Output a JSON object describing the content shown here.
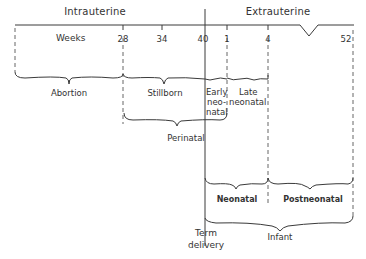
{
  "diagram": {
    "headers": {
      "intrauterine": "Intrauterine",
      "extrauterine": "Extrauterine"
    },
    "axis": {
      "unit_label": "Weeks",
      "ticks": [
        "28",
        "34",
        "40",
        "1",
        "4",
        "52"
      ]
    },
    "periods": {
      "abortion": "Abortion",
      "stillborn": "Stillborn",
      "early_neonatal_1": "Early",
      "early_neonatal_2": "neo-",
      "early_neonatal_3": "natal",
      "late_neonatal_1": "Late",
      "late_neonatal_2": "neonatal",
      "perinatal": "Perinatal",
      "neonatal": "Neonatal",
      "postneonatal": "Postneonatal",
      "infant": "Infant"
    },
    "event": {
      "line1": "Term",
      "line2": "delivery"
    },
    "colors": {
      "line": "#3a3a3a",
      "background": "#ffffff"
    }
  }
}
